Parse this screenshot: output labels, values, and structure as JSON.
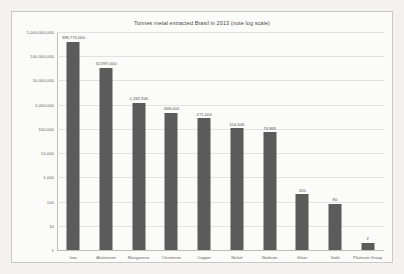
{
  "chart_data": {
    "type": "bar",
    "title": "Tonnes metal extracted Brasil in 2013 (note log scale)",
    "xlabel": "",
    "ylabel": "",
    "scale": "log",
    "grid": true,
    "legend": "none",
    "ylim": [
      1,
      1000000000
    ],
    "categories": [
      "Iron",
      "Aluminium",
      "Manganese",
      "Chromium",
      "Copper",
      "Nickel",
      "Niobium",
      "Silver",
      "Gold",
      "Platinum Group"
    ],
    "values": [
      398773000,
      32997000,
      1182946,
      468000,
      271000,
      104606,
      73969,
      200,
      80,
      2
    ],
    "value_labels": [
      "398,773,000",
      "32,997,000",
      "1,182,946",
      "468,000",
      "271,000",
      "104,606",
      "73,969",
      "200",
      "80",
      "2"
    ],
    "y_ticks": [
      1000000000,
      100000000,
      10000000,
      1000000,
      100000,
      10000,
      1000,
      100,
      10,
      1
    ],
    "y_tick_labels": [
      "1,000,000,000",
      "100,000,000",
      "10,000,000",
      "1,000,000",
      "100,000",
      "10,000",
      "1,000",
      "100",
      "10",
      "1"
    ],
    "colors": {
      "bar": "#5b5b5b",
      "grid": "#e3e2de",
      "axis": "#bdbcb8",
      "plot_background": "#fbfbfa",
      "page_background": "#f3f2f0",
      "text": "#4a4a4a"
    }
  }
}
